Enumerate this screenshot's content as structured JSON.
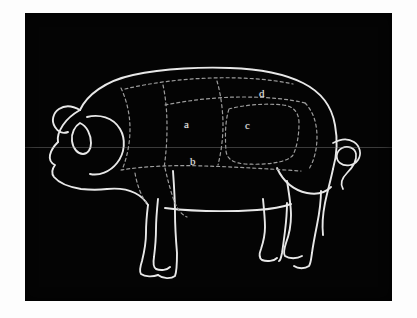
{
  "figure": {
    "style": "white line drawing on black background",
    "background_color": "#040404",
    "line_color": "#e8e8e8",
    "dashed_line_color": "#9a9a9a",
    "frame_color": "#fdfdfd",
    "label_color": "#efefef"
  },
  "labels": [
    {
      "id": "a",
      "text": "a",
      "x": 184,
      "y": 126
    },
    {
      "id": "b",
      "text": "b",
      "x": 190,
      "y": 163
    },
    {
      "id": "c",
      "text": "c",
      "x": 245,
      "y": 127
    },
    {
      "id": "d",
      "text": "d",
      "x": 259,
      "y": 95
    }
  ],
  "parts": {
    "head": "head-outline",
    "ear": "ear-outline",
    "eye": "eye-outline",
    "snout": "snout-outline",
    "back": "back-outline",
    "belly": "belly-line",
    "tail": "curly-tail",
    "front_legs": "front-legs",
    "rear_legs": "rear-legs"
  }
}
